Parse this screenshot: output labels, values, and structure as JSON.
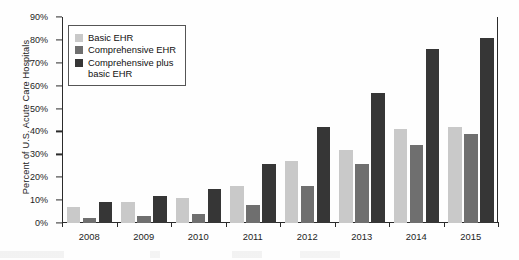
{
  "chart_data": {
    "type": "bar",
    "title": "",
    "xlabel": "",
    "ylabel": "Percent of U.S. Acute Care Hospitals",
    "categories": [
      "2008",
      "2009",
      "2010",
      "2011",
      "2012",
      "2013",
      "2014",
      "2015"
    ],
    "series": [
      {
        "name": "Basic EHR",
        "color": "#c9c9c9",
        "values": [
          7,
          9,
          11,
          16,
          27,
          32,
          41,
          42
        ]
      },
      {
        "name": "Comprehensive EHR",
        "color": "#6f6f6f",
        "values": [
          2,
          3,
          4,
          8,
          16,
          26,
          34,
          39
        ]
      },
      {
        "name": "Comprehensive plus basic EHR",
        "color": "#363636",
        "values": [
          9,
          12,
          15,
          26,
          42,
          57,
          76,
          81
        ]
      }
    ],
    "ylim": [
      0,
      90
    ],
    "ytick_values": [
      0,
      10,
      20,
      30,
      40,
      50,
      60,
      70,
      80,
      90
    ],
    "ytick_labels": [
      "0%",
      "10%",
      "20%",
      "30%",
      "40%",
      "50%",
      "60%",
      "70%",
      "80%",
      "90%"
    ],
    "grid": false,
    "legend_position": "upper-left",
    "legend_entries": [
      "Basic EHR",
      "Comprehensive EHR",
      "Comprehensive plus\nbasic EHR"
    ]
  }
}
